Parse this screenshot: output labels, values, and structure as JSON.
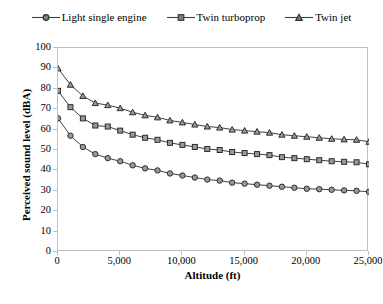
{
  "chart_data": {
    "type": "line",
    "title": "",
    "xlabel": "Altitude (ft)",
    "ylabel": "Perceived sound level (dBA)",
    "xlim": [
      0,
      25000
    ],
    "ylim": [
      0,
      100
    ],
    "xticks": [
      "0",
      "5,000",
      "10,000",
      "15,000",
      "20,000",
      "25,000"
    ],
    "xtick_values": [
      0,
      5000,
      10000,
      15000,
      20000,
      25000
    ],
    "yticks": [
      "0",
      "10",
      "20",
      "30",
      "40",
      "50",
      "60",
      "70",
      "80",
      "90",
      "100"
    ],
    "ytick_values": [
      0,
      10,
      20,
      30,
      40,
      50,
      60,
      70,
      80,
      90,
      100
    ],
    "grid": false,
    "legend_position": "top",
    "x": [
      0,
      1000,
      2000,
      3000,
      4000,
      5000,
      6000,
      7000,
      8000,
      9000,
      10000,
      11000,
      12000,
      13000,
      14000,
      15000,
      16000,
      17000,
      18000,
      19000,
      20000,
      21000,
      22000,
      23000,
      24000,
      25000
    ],
    "series": [
      {
        "name": "Light single engine",
        "marker": "circle",
        "color": "#404040",
        "values": [
          65.5,
          57,
          51.5,
          48,
          46,
          44.5,
          42.5,
          41,
          40,
          38.5,
          37.5,
          36.5,
          35.5,
          35,
          34,
          33.5,
          33,
          32.5,
          32,
          31.5,
          31,
          30.8,
          30.5,
          30.2,
          30,
          29.5
        ]
      },
      {
        "name": "Twin turboprop",
        "marker": "square",
        "color": "#404040",
        "values": [
          79,
          71,
          65.5,
          62,
          61.5,
          59.5,
          57.5,
          56,
          55,
          53.5,
          52.5,
          51.5,
          50.5,
          50,
          49,
          48.5,
          48,
          47.5,
          46.5,
          46,
          45.5,
          45,
          44.5,
          44.2,
          44,
          43
        ]
      },
      {
        "name": "Twin jet",
        "marker": "triangle",
        "color": "#404040",
        "values": [
          90,
          82,
          76.5,
          73,
          72,
          70.5,
          68.5,
          67,
          66,
          64.5,
          63.5,
          62.5,
          61.5,
          61,
          60,
          59.5,
          59,
          58.5,
          57.5,
          57,
          56.5,
          56,
          55.5,
          55.2,
          55,
          54
        ]
      }
    ]
  },
  "legend": {
    "items": [
      {
        "label": "Light single engine",
        "marker": "circle"
      },
      {
        "label": "Twin turboprop",
        "marker": "square"
      },
      {
        "label": "Twin jet",
        "marker": "triangle"
      }
    ]
  }
}
